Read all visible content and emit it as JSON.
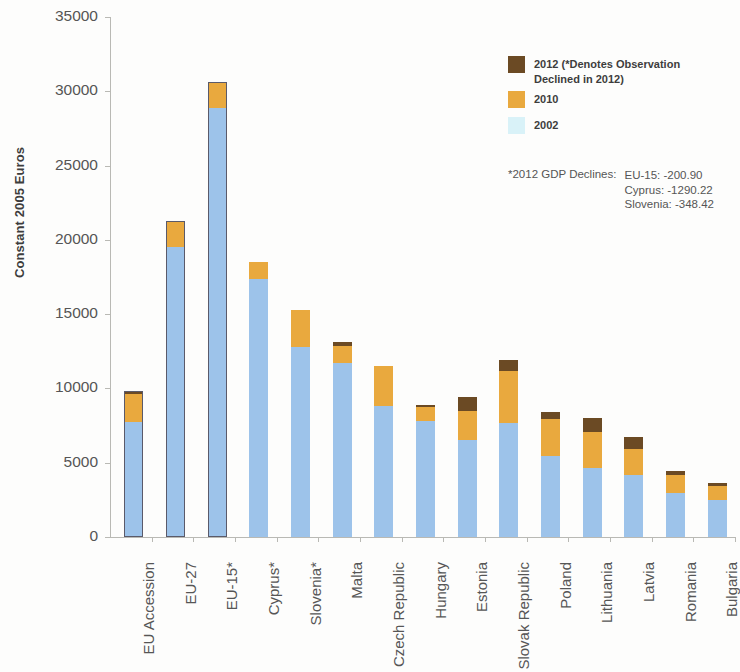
{
  "chart_data": {
    "type": "bar",
    "subtype": "stacked-bar",
    "title": "",
    "xlabel": "",
    "ylabel": "Constant 2005 Euros",
    "ylim": [
      0,
      35000
    ],
    "ytick_values": [
      0,
      5000,
      10000,
      15000,
      20000,
      25000,
      30000,
      35000
    ],
    "ytick_labels": [
      "0",
      "5000",
      "10000",
      "15000",
      "20000",
      "25000",
      "30000",
      "35000"
    ],
    "grid": false,
    "legend_position": "upper-right-inside",
    "categories": [
      "EU Accession",
      "EU-27",
      "EU-15*",
      "Cyprus*",
      "Slovenia*",
      "Malta",
      "Czech Republic",
      "Hungary",
      "Estonia",
      "Slovak Republic",
      "Poland",
      "Lithuania",
      "Latvia",
      "Romania",
      "Bulgaria"
    ],
    "series": [
      {
        "name": "2002",
        "color": "#9dc3ea",
        "values": [
          7750,
          19500,
          28900,
          17400,
          12800,
          11700,
          8800,
          7800,
          6500,
          7700,
          5450,
          4650,
          4150,
          2950,
          2500
        ]
      },
      {
        "name": "2010",
        "color": "#e9a93e",
        "values": [
          1900,
          1800,
          1750,
          1100,
          2450,
          1150,
          2700,
          950,
          1950,
          3500,
          2500,
          2400,
          1800,
          1200,
          950
        ]
      },
      {
        "name": "2012",
        "color": "#6b4a24",
        "values": [
          200,
          0,
          0,
          0,
          0,
          250,
          0,
          150,
          1000,
          700,
          450,
          950,
          750,
          300,
          200
        ]
      }
    ],
    "totals": [
      9850,
      21300,
      30650,
      18500,
      15250,
      13100,
      11500,
      8900,
      9450,
      11900,
      8400,
      8000,
      6700,
      4450,
      3650
    ],
    "outlined_bars": [
      "EU Accession",
      "EU-27",
      "EU-15*"
    ]
  },
  "legend": {
    "items": [
      {
        "swatch": "brown",
        "label_line1": "2012 (*Denotes Observation",
        "label_line2": "Declined in 2012)"
      },
      {
        "swatch": "orange",
        "label_line1": "2010",
        "label_line2": ""
      },
      {
        "swatch": "lightcyan",
        "label_line1": "2002",
        "label_line2": ""
      }
    ]
  },
  "declines": {
    "title": "*2012 GDP Declines:",
    "entries": [
      "EU-15: -200.90",
      "Cyprus: -1290.22",
      "Slovenia: -348.42"
    ]
  },
  "colors": {
    "series_2002": "#9dc3ea",
    "series_2010": "#e9a93e",
    "series_2012": "#6b4a24",
    "legend_2002_swatch": "#d9f2f8",
    "axis": "#b9b9b4",
    "text": "#555555"
  }
}
